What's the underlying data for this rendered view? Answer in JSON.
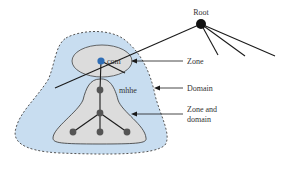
{
  "diagram": {
    "root_label": "Root",
    "com_label": "com",
    "mhhe_label": "mhhe",
    "annotations": {
      "zone": "Zone",
      "domain": "Domain",
      "zone_and_domain_line1": "Zone and",
      "zone_and_domain_line2": "domain"
    },
    "colors": {
      "domain_fill": "#c8ddf0",
      "domain_stroke": "#555555",
      "zone_fill": "#dcdcdc",
      "com_node": "#2f6db5",
      "root_node": "#111111",
      "tree_node": "#555555",
      "line": "#1a1a1a"
    }
  }
}
